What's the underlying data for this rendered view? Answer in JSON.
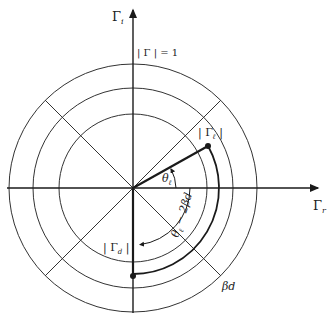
{
  "diagram": {
    "type": "polar reflection-coefficient diagram",
    "center": [
      133,
      188
    ],
    "colors": {
      "line": "#333333",
      "heavy": "#1a1a1a",
      "background": "#ffffff"
    },
    "axes": {
      "imag_label": "Γi",
      "imag_label_main": "Γ",
      "imag_label_sub": "i",
      "real_label": "Γr",
      "real_label_main": "Γ",
      "real_label_sub": "r"
    },
    "circles": [
      {
        "name": "unit-circle",
        "radius": 124
      },
      {
        "name": "middle-circle",
        "radius": 100
      },
      {
        "name": "inner-circle",
        "radius": 74
      }
    ],
    "labels": {
      "unit_circle": "| Γ | = 1",
      "gamma_l": "| Γℓ |",
      "gamma_l_main": "| Γ",
      "gamma_l_sub": "ℓ",
      "gamma_l_end": " |",
      "gamma_d_main": "| Γ",
      "gamma_d_sub": "d",
      "gamma_d_end": " |",
      "theta_l_main": "θ",
      "theta_l_sub": "ℓ",
      "theta_diff": "θℓ − 2βd",
      "theta_diff_main": "θ",
      "theta_diff_sub": "ℓ",
      "theta_diff_rest": " − 2βd",
      "beta_d": "βd"
    },
    "points": {
      "gamma_l": {
        "radius": 86,
        "angle_deg": 29
      },
      "gamma_d": {
        "radius": 88,
        "angle_deg": -90
      }
    }
  }
}
